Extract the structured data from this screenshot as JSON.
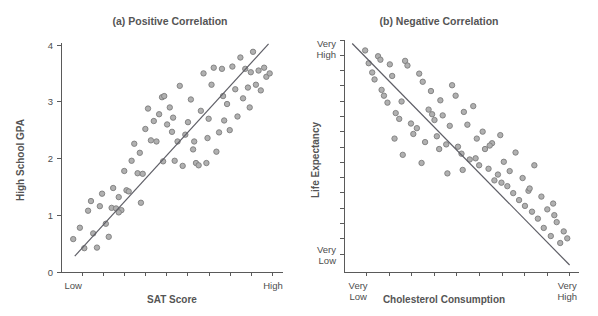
{
  "figure": {
    "background": "#ffffff",
    "point_color": "#b0b0b0",
    "point_edge_color": "#7d7d7d",
    "line_color": "#5e5e66",
    "axis_color": "#5a5a5a",
    "text_color": "#4d4d4d"
  },
  "chart_data": [
    {
      "type": "scatter",
      "panel": "a",
      "title": "(a) Positive Correlation",
      "xlabel": "SAT Score",
      "ylabel": "High School GPA",
      "xlim": [
        0,
        10
      ],
      "ylim": [
        0,
        4
      ],
      "grid": false,
      "legend": "none",
      "x_tick_labels": [
        "Low",
        "High"
      ],
      "x_tick_label_positions": [
        0.55,
        9.55
      ],
      "x_minor_tick_count": 10,
      "y_ticks": [
        0,
        1,
        2,
        3,
        4
      ],
      "y_tick_labels": [
        "0",
        "1",
        "2",
        "3",
        "4"
      ],
      "trendline": {
        "x0": 0.62,
        "y0": 0.28,
        "x1": 9.35,
        "y1": 4.02
      },
      "x": [
        0.55,
        0.85,
        1.05,
        1.22,
        1.35,
        1.45,
        1.62,
        1.75,
        1.85,
        2.02,
        2.15,
        2.28,
        2.35,
        2.48,
        2.6,
        2.72,
        2.85,
        2.95,
        3.05,
        3.18,
        3.3,
        3.45,
        3.55,
        3.68,
        3.8,
        3.92,
        4.05,
        4.18,
        4.3,
        4.42,
        4.55,
        4.65,
        4.78,
        4.9,
        5.0,
        5.12,
        5.25,
        5.35,
        5.48,
        5.6,
        5.72,
        5.85,
        5.95,
        6.08,
        6.2,
        6.3,
        6.42,
        6.55,
        6.65,
        6.78,
        6.88,
        7.0,
        7.12,
        7.25,
        7.35,
        7.48,
        7.6,
        7.72,
        7.85,
        7.95,
        8.08,
        8.2,
        8.3,
        8.42,
        8.55,
        8.65,
        8.78,
        8.9,
        9.0,
        9.15,
        9.25,
        9.4,
        5.05,
        6.0,
        6.6,
        7.3,
        4.6,
        3.6,
        2.6,
        8.5
      ],
      "y": [
        0.58,
        0.78,
        0.42,
        1.08,
        1.25,
        0.68,
        0.43,
        1.16,
        1.38,
        0.85,
        0.62,
        1.13,
        1.48,
        1.12,
        1.32,
        1.09,
        1.78,
        1.44,
        1.42,
        1.96,
        2.26,
        1.74,
        2.1,
        1.73,
        2.52,
        2.88,
        2.32,
        2.66,
        2.3,
        2.78,
        3.08,
        3.1,
        2.6,
        2.9,
        2.47,
        1.96,
        2.3,
        3.28,
        1.87,
        2.42,
        2.64,
        3.04,
        2.16,
        1.92,
        1.88,
        2.84,
        3.5,
        1.92,
        2.7,
        3.3,
        3.6,
        2.12,
        2.46,
        3.58,
        2.67,
        2.96,
        2.5,
        3.62,
        3.22,
        2.74,
        3.78,
        3.06,
        3.58,
        3.25,
        3.52,
        3.88,
        3.3,
        3.55,
        3.2,
        3.6,
        3.44,
        3.5,
        2.72,
        2.3,
        2.36,
        3.1,
        1.95,
        1.22,
        1.05,
        2.9
      ]
    },
    {
      "type": "scatter",
      "panel": "b",
      "title": "(b) Negative Correlation",
      "xlabel": "Cholesterol Consumption",
      "ylabel": "Life Expectancy",
      "xlim": [
        0,
        10
      ],
      "ylim": [
        0,
        10
      ],
      "grid": false,
      "legend": "none",
      "x_tick_labels": [
        "Very\nLow",
        "Very\nHigh"
      ],
      "x_tick_label_positions": [
        0.6,
        9.5
      ],
      "x_minor_tick_count": 10,
      "y_tick_labels": [
        "Very\nHigh",
        "Very\nLow"
      ],
      "y_tick_label_positions": [
        9.6,
        0.72
      ],
      "y_minor_tick_count": 14,
      "trendline": {
        "x0": 0.35,
        "y0": 9.85,
        "x1": 9.6,
        "y1": 0.3
      },
      "x": [
        0.9,
        1.05,
        1.2,
        1.3,
        1.45,
        1.55,
        1.7,
        1.85,
        1.95,
        2.05,
        2.2,
        2.35,
        2.45,
        2.6,
        2.7,
        2.85,
        2.95,
        3.1,
        3.2,
        3.35,
        3.45,
        3.6,
        3.7,
        3.85,
        3.95,
        4.1,
        4.2,
        4.35,
        4.5,
        4.6,
        4.75,
        4.85,
        5.0,
        5.1,
        5.25,
        5.35,
        5.5,
        5.65,
        5.75,
        5.9,
        6.0,
        6.15,
        6.3,
        6.4,
        6.55,
        6.65,
        6.8,
        6.95,
        7.05,
        7.2,
        7.3,
        7.45,
        7.6,
        7.7,
        7.85,
        8.0,
        8.1,
        8.25,
        8.4,
        8.5,
        8.65,
        8.8,
        8.9,
        9.05,
        9.2,
        9.35,
        9.5,
        2.5,
        3.3,
        4.4,
        5.6,
        6.7,
        2.15,
        4.05,
        5.05,
        6.2,
        1.6,
        3.75,
        7.9,
        8.95
      ],
      "y": [
        9.55,
        9.0,
        8.6,
        8.3,
        9.3,
        9.15,
        7.6,
        7.3,
        8.95,
        8.45,
        6.85,
        6.6,
        7.35,
        9.1,
        8.9,
        6.4,
        5.95,
        6.2,
        8.55,
        8.2,
        5.6,
        7.0,
        7.8,
        6.55,
        5.85,
        7.4,
        6.75,
        5.5,
        6.3,
        8.05,
        7.6,
        5.4,
        5.1,
        6.9,
        6.35,
        4.85,
        7.15,
        5.75,
        4.6,
        6.05,
        5.3,
        4.45,
        5.55,
        3.95,
        4.2,
        5.9,
        4.75,
        3.7,
        4.35,
        3.4,
        5.15,
        3.1,
        4.05,
        2.85,
        3.5,
        2.6,
        4.6,
        2.3,
        3.25,
        1.9,
        2.7,
        1.55,
        2.95,
        2.15,
        1.25,
        1.75,
        1.45,
        5.05,
        4.7,
        4.25,
        4.9,
        3.85,
        5.75,
        5.3,
        4.4,
        5.45,
        7.85,
        6.8,
        3.6,
        2.45
      ]
    }
  ]
}
